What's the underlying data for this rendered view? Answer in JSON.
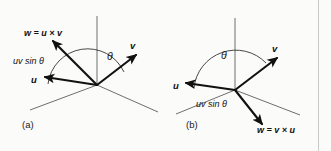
{
  "figure": {
    "background_color": "#fbfbfa",
    "vector_color": "#111111",
    "axis_color": "#6e6e6e",
    "panels": [
      {
        "id": "a",
        "caption": "(a)",
        "labels": {
          "cross_product": "w = u × v",
          "magnitude": "uv sin θ",
          "angle": "θ",
          "vector_u": "u",
          "vector_v": "v"
        }
      },
      {
        "id": "b",
        "caption": "(b)",
        "labels": {
          "cross_product": "w = v × u",
          "magnitude": "uv sin θ",
          "angle": "θ",
          "vector_u": "u",
          "vector_v": "v"
        }
      }
    ],
    "divider_x": 318
  }
}
